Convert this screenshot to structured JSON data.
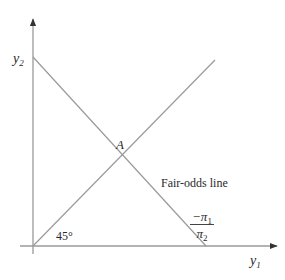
{
  "diagram": {
    "type": "economics-diagram",
    "axes": {
      "x_label_main": "y",
      "x_label_sub": "1",
      "y_label_main": "y",
      "y_label_sub": "2"
    },
    "lines": {
      "certainty_line_label": "45°",
      "fair_odds_line_label": "Fair-odds line",
      "slope_numerator": "−π",
      "slope_numerator_sub": "1",
      "slope_denominator": "π",
      "slope_denominator_sub": "2"
    },
    "points": {
      "intersection_label": "A"
    },
    "colors": {
      "line": "#9a9a9a",
      "axis": "#9a9a9a",
      "text": "#2a2a2a",
      "background": "#ffffff"
    }
  }
}
